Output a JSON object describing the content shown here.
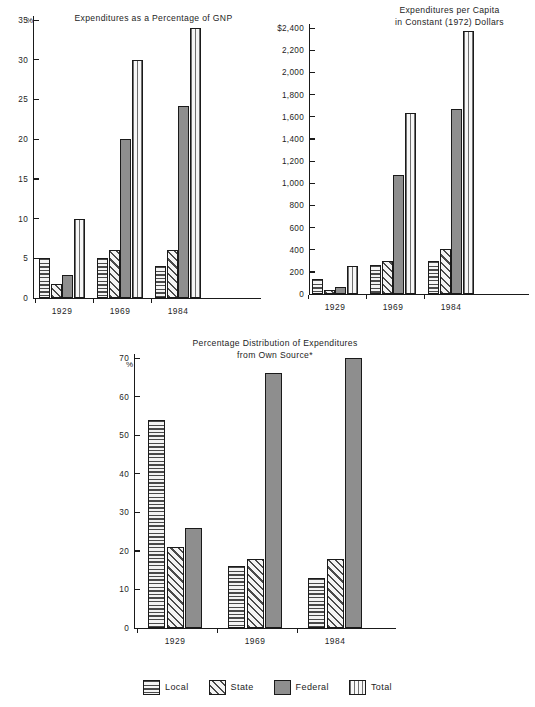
{
  "series_defs": [
    {
      "key": "local",
      "label": "Local",
      "pattern": "horizontal-stripes"
    },
    {
      "key": "state",
      "label": "State",
      "pattern": "diagonal-stripes"
    },
    {
      "key": "federal",
      "label": "Federal",
      "pattern": "solid-gray"
    },
    {
      "key": "total",
      "label": "Total",
      "pattern": "vertical-stripes"
    }
  ],
  "legend": {
    "position": "bottom-center",
    "items": [
      {
        "label": "Local",
        "pattern": "horizontal-stripes"
      },
      {
        "label": "State",
        "pattern": "diagonal-stripes"
      },
      {
        "label": "Federal",
        "pattern": "solid-gray"
      },
      {
        "label": "Total",
        "pattern": "vertical-stripes"
      }
    ]
  },
  "chart_data": [
    {
      "id": "gnp",
      "type": "bar",
      "title": "Expenditures as a Percentage of GNP",
      "xlabel": "",
      "ylabel": "%",
      "ylim": [
        0,
        35
      ],
      "ytick_step": 5,
      "yticks": [
        0,
        5,
        10,
        15,
        20,
        25,
        30,
        35
      ],
      "ytick_labels": [
        "0",
        "5",
        "10",
        "15",
        "20",
        "25",
        "30",
        "35"
      ],
      "grid": false,
      "categories": [
        "1929",
        "1969",
        "1984"
      ],
      "series": [
        {
          "name": "Local",
          "values": [
            5.0,
            5.0,
            4.0
          ]
        },
        {
          "name": "State",
          "values": [
            1.8,
            6.0,
            6.0
          ]
        },
        {
          "name": "Federal",
          "values": [
            2.9,
            20.0,
            24.2
          ]
        },
        {
          "name": "Total",
          "values": [
            10.0,
            30.0,
            34.0
          ]
        }
      ]
    },
    {
      "id": "percapita",
      "type": "bar",
      "title": "Expenditures per Capita\nin Constant (1972) Dollars",
      "xlabel": "",
      "ylabel": "",
      "ylim": [
        0,
        2400
      ],
      "ytick_step": 200,
      "yticks": [
        0,
        200,
        400,
        600,
        800,
        1000,
        1200,
        1400,
        1600,
        1800,
        2000,
        2200,
        2400
      ],
      "ytick_labels": [
        "0",
        "200",
        "400",
        "600",
        "800",
        "1,000",
        "1,200",
        "1,400",
        "1,600",
        "1,800",
        "2,000",
        "2,200",
        "$2,400"
      ],
      "grid": false,
      "categories": [
        "1929",
        "1969",
        "1984"
      ],
      "series": [
        {
          "name": "Local",
          "values": [
            135,
            260,
            295
          ]
        },
        {
          "name": "State",
          "values": [
            40,
            295,
            410
          ]
        },
        {
          "name": "Federal",
          "values": [
            60,
            1075,
            1665
          ]
        },
        {
          "name": "Total",
          "values": [
            255,
            1630,
            2375
          ]
        }
      ]
    },
    {
      "id": "distribution",
      "type": "bar",
      "title": "Percentage Distribution of Expenditures\nfrom Own Source*",
      "xlabel": "",
      "ylabel": "%",
      "ylim": [
        0,
        70
      ],
      "ytick_step": 10,
      "yticks": [
        0,
        10,
        20,
        30,
        40,
        50,
        60,
        70
      ],
      "ytick_labels": [
        "0",
        "10",
        "20",
        "30",
        "40",
        "50",
        "60",
        "70"
      ],
      "grid": false,
      "categories": [
        "1929",
        "1969",
        "1984"
      ],
      "series": [
        {
          "name": "Local",
          "values": [
            54,
            16,
            13
          ]
        },
        {
          "name": "State",
          "values": [
            21,
            18,
            18
          ]
        },
        {
          "name": "Federal",
          "values": [
            26,
            66,
            70
          ]
        }
      ]
    }
  ]
}
